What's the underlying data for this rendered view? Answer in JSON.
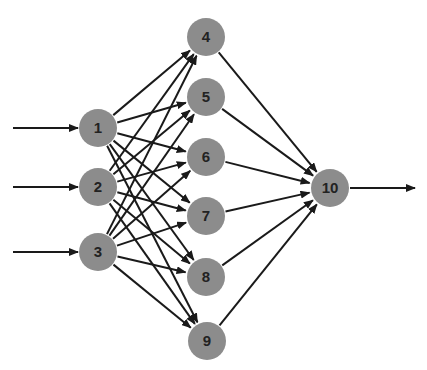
{
  "diagram": {
    "type": "feedforward-neural-network",
    "colors": {
      "node_fill": "#8c8c8c",
      "edge": "#1a1a1a",
      "label": "#222222",
      "background": "#ffffff"
    },
    "node_radius": 19,
    "layers": [
      {
        "name": "input",
        "nodes": [
          "1",
          "2",
          "3"
        ]
      },
      {
        "name": "hidden",
        "nodes": [
          "4",
          "5",
          "6",
          "7",
          "8",
          "9"
        ]
      },
      {
        "name": "output",
        "nodes": [
          "10"
        ]
      }
    ],
    "nodes": [
      {
        "id": "1",
        "label": "1",
        "x": 98,
        "y": 128
      },
      {
        "id": "2",
        "label": "2",
        "x": 98,
        "y": 187
      },
      {
        "id": "3",
        "label": "3",
        "x": 98,
        "y": 252
      },
      {
        "id": "4",
        "label": "4",
        "x": 206,
        "y": 37
      },
      {
        "id": "5",
        "label": "5",
        "x": 206,
        "y": 97
      },
      {
        "id": "6",
        "label": "6",
        "x": 206,
        "y": 157
      },
      {
        "id": "7",
        "label": "7",
        "x": 206,
        "y": 216
      },
      {
        "id": "8",
        "label": "8",
        "x": 206,
        "y": 277
      },
      {
        "id": "9",
        "label": "9",
        "x": 207,
        "y": 341
      },
      {
        "id": "10",
        "label": "10",
        "x": 330,
        "y": 188
      }
    ],
    "external_inputs": [
      {
        "to": "1",
        "x1": 13,
        "y1": 128
      },
      {
        "to": "2",
        "x1": 13,
        "y1": 187
      },
      {
        "to": "3",
        "x1": 13,
        "y1": 252
      }
    ],
    "external_output": {
      "from": "10",
      "x2": 415,
      "y2": 188
    },
    "edges": [
      [
        "1",
        "4"
      ],
      [
        "1",
        "5"
      ],
      [
        "1",
        "6"
      ],
      [
        "1",
        "7"
      ],
      [
        "1",
        "8"
      ],
      [
        "1",
        "9"
      ],
      [
        "2",
        "4"
      ],
      [
        "2",
        "5"
      ],
      [
        "2",
        "6"
      ],
      [
        "2",
        "7"
      ],
      [
        "2",
        "8"
      ],
      [
        "2",
        "9"
      ],
      [
        "3",
        "4"
      ],
      [
        "3",
        "5"
      ],
      [
        "3",
        "6"
      ],
      [
        "3",
        "7"
      ],
      [
        "3",
        "8"
      ],
      [
        "3",
        "9"
      ],
      [
        "4",
        "10"
      ],
      [
        "5",
        "10"
      ],
      [
        "6",
        "10"
      ],
      [
        "7",
        "10"
      ],
      [
        "8",
        "10"
      ],
      [
        "9",
        "10"
      ]
    ]
  }
}
